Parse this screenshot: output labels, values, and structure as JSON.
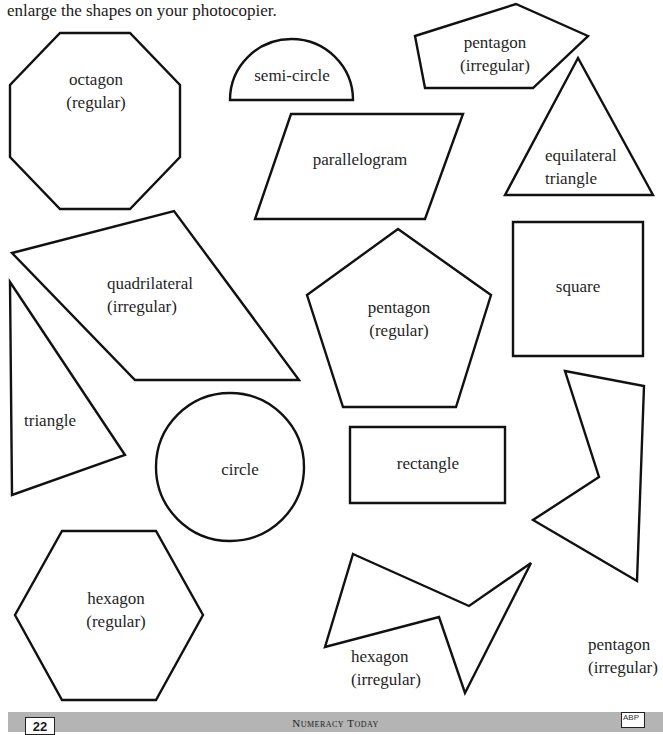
{
  "intro_text": "enlarge the shapes on your photocopier.",
  "colors": {
    "stroke": "#111111",
    "text": "#1f1f1f",
    "footer_band": "#b4b4b4",
    "background": "#ffffff"
  },
  "shapes": [
    {
      "id": "octagon-regular",
      "type": "polygon",
      "label_line1": "octagon",
      "label_line2": "(regular)",
      "points": "60,33 130,33 180,85 180,157 130,209 60,209 10,157 10,85"
    },
    {
      "id": "semi-circle",
      "type": "path",
      "label_line1": "semi-circle",
      "label_line2": "",
      "path": "M230,100 A61.5,61 0 0 1 353,100 Z"
    },
    {
      "id": "pentagon-irregular-top",
      "type": "polygon",
      "label_line1": "pentagon",
      "label_line2": "(irregular)",
      "points": "415,36 516,4 588,36 533,88 425,88"
    },
    {
      "id": "parallelogram",
      "type": "polygon",
      "label_line1": "parallelogram",
      "label_line2": "",
      "points": "291,114 463,114 425,219 255,219"
    },
    {
      "id": "equilateral-triangle",
      "type": "polygon",
      "label_line1": "equilateral",
      "label_line2": "triangle",
      "points": "578,58 505,195 653,195"
    },
    {
      "id": "quadrilateral-irregular",
      "type": "polygon",
      "label_line1": "quadrilateral",
      "label_line2": "(irregular)",
      "points": "12,253 174,211 299,380 135,380"
    },
    {
      "id": "triangle",
      "type": "polygon",
      "label_line1": "triangle",
      "label_line2": "",
      "points": "10,282 125,455 12,495"
    },
    {
      "id": "pentagon-regular",
      "type": "polygon",
      "label_line1": "pentagon",
      "label_line2": "(regular)",
      "points": "398,229 491,295 456,407 343,407 307,295"
    },
    {
      "id": "square",
      "type": "polygon",
      "label_line1": "square",
      "label_line2": "",
      "points": "513,222 643,222 643,356 513,356"
    },
    {
      "id": "circle",
      "type": "circle",
      "label_line1": "circle",
      "label_line2": "",
      "cx": 230,
      "cy": 467,
      "r": 74
    },
    {
      "id": "rectangle",
      "type": "polygon",
      "label_line1": "rectangle",
      "label_line2": "",
      "points": "350,427 505,427 505,503 350,503"
    },
    {
      "id": "pentagon-irregular-right",
      "type": "polygon",
      "label_line1": "pentagon",
      "label_line2": "(irregular)",
      "points": "565,371 644,386 637,581 533,520 599,477"
    },
    {
      "id": "hexagon-regular",
      "type": "polygon",
      "label_line1": "hexagon",
      "label_line2": "(regular)",
      "points": "62,531 156,531 203,615 156,700 62,700 15,615"
    },
    {
      "id": "hexagon-irregular",
      "type": "polygon",
      "label_line1": "hexagon",
      "label_line2": "(irregular)",
      "points": "353,554 469,606 531,563 465,693 439,617 325,647"
    }
  ],
  "footer": {
    "page_number": "22",
    "title": "Numeracy Today",
    "logo": "ABP"
  }
}
